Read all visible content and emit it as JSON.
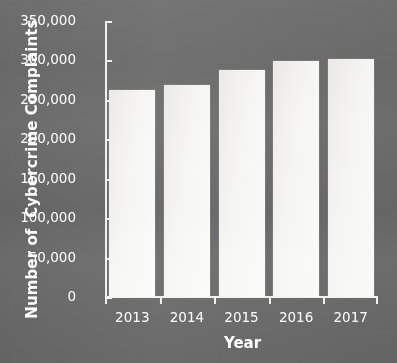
{
  "chart_data": {
    "type": "bar",
    "title": "",
    "xlabel": "Year",
    "ylabel": "Number of  Cybercrime Complaints",
    "categories": [
      "2013",
      "2014",
      "2015",
      "2016",
      "2017"
    ],
    "values": [
      262813,
      269422,
      288012,
      298728,
      301580
    ],
    "series": [
      {
        "name": "Cybercrime Complaints",
        "values": [
          262813,
          269422,
          288012,
          298728,
          301580
        ]
      }
    ],
    "ylim": [
      0,
      350000
    ],
    "ytick_labels": [
      "0",
      "50,000",
      "100,000",
      "150,000",
      "200,000",
      "250,000",
      "300,000",
      "350,000"
    ],
    "ytick_values": [
      0,
      50000,
      100000,
      150000,
      200000,
      250000,
      300000,
      350000
    ],
    "grid": false,
    "legend": null,
    "bar_color": "#f4f4f2",
    "background_color": "#6e6e6e",
    "axis_color": "#f0f0ee",
    "text_color": "#ffffff"
  }
}
